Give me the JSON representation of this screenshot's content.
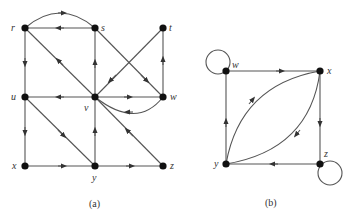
{
  "figures": [
    {
      "id": "a",
      "caption": "(a)",
      "nodes": [
        {
          "name": "r",
          "label": "r"
        },
        {
          "name": "s",
          "label": "s"
        },
        {
          "name": "t",
          "label": "t"
        },
        {
          "name": "u",
          "label": "u"
        },
        {
          "name": "v",
          "label": "v"
        },
        {
          "name": "w",
          "label": "w"
        },
        {
          "name": "x",
          "label": "x"
        },
        {
          "name": "y",
          "label": "y"
        },
        {
          "name": "z",
          "label": "z"
        }
      ],
      "edges": [
        [
          "r",
          "s",
          "curved"
        ],
        [
          "s",
          "r"
        ],
        [
          "r",
          "u"
        ],
        [
          "v",
          "r"
        ],
        [
          "s",
          "w"
        ],
        [
          "v",
          "s"
        ],
        [
          "t",
          "v"
        ],
        [
          "w",
          "t"
        ],
        [
          "v",
          "u"
        ],
        [
          "v",
          "w"
        ],
        [
          "w",
          "v",
          "curved"
        ],
        [
          "u",
          "x"
        ],
        [
          "u",
          "y"
        ],
        [
          "y",
          "v"
        ],
        [
          "z",
          "v"
        ],
        [
          "x",
          "y"
        ],
        [
          "y",
          "z"
        ]
      ]
    },
    {
      "id": "b",
      "caption": "(b)",
      "nodes": [
        {
          "name": "w",
          "label": "w"
        },
        {
          "name": "x",
          "label": "x"
        },
        {
          "name": "y",
          "label": "y"
        },
        {
          "name": "z",
          "label": "z"
        }
      ],
      "edges": [
        [
          "w",
          "w",
          "loop"
        ],
        [
          "w",
          "x"
        ],
        [
          "x",
          "z"
        ],
        [
          "z",
          "y"
        ],
        [
          "y",
          "w"
        ],
        [
          "y",
          "x",
          "curved"
        ],
        [
          "x",
          "y",
          "curved"
        ],
        [
          "z",
          "z",
          "loop"
        ]
      ]
    }
  ]
}
